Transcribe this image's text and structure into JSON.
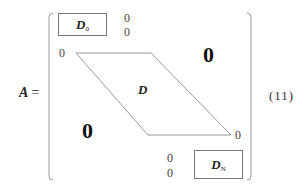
{
  "equation": {
    "lhs_symbol": "A",
    "equals_sign": "=",
    "number": "(11)",
    "matrix": {
      "top_block": {
        "label": "D",
        "subscript": "0"
      },
      "top_right_zeros": [
        "0",
        "0"
      ],
      "band_left_zero": "0",
      "band_label": "D",
      "upper_right_zero": "0",
      "lower_left_zero": "0",
      "band_right_zero": "0",
      "bottom_left_zeros": [
        "0",
        "0"
      ],
      "bottom_block": {
        "label": "D",
        "subscript": "N"
      }
    }
  }
}
